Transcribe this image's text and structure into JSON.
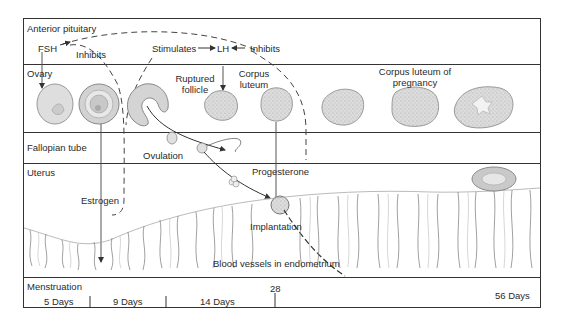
{
  "rows": {
    "pituitary": {
      "label": "Anterior pituitary"
    },
    "ovary": {
      "label": "Ovary"
    },
    "fallopian": {
      "label": "Fallopian tube"
    },
    "uterus": {
      "label": "Uterus"
    },
    "menstruation": {
      "label": "Menstruation"
    }
  },
  "hormones": {
    "fsh": "FSH",
    "lh": "LH",
    "inhibits_fsh": "Inhibits",
    "stimulates_lh": "Stimulates",
    "inhibits_lh": "Inhibits",
    "estrogen": "Estrogen",
    "progesterone": "Progesterone"
  },
  "ovary_labels": {
    "ruptured_follicle_1": "Ruptured",
    "ruptured_follicle_2": "follicle",
    "corpus_luteum_1": "Corpus",
    "corpus_luteum_2": "luteum",
    "corpus_luteum_pregnancy_1": "Corpus luteum of",
    "corpus_luteum_pregnancy_2": "pregnancy"
  },
  "events": {
    "ovulation": "Ovulation",
    "implantation": "Implantation",
    "blood_vessels": "Blood vessels in endometrium"
  },
  "timeline": {
    "day_28": "28",
    "segments": [
      "5 Days",
      "9 Days",
      "14 Days",
      "56 Days"
    ]
  },
  "colors": {
    "line": "#333333",
    "tissue_fill": "#d9d9d9",
    "tissue_stroke": "#9a9a9a",
    "text": "#2a2a2a"
  }
}
